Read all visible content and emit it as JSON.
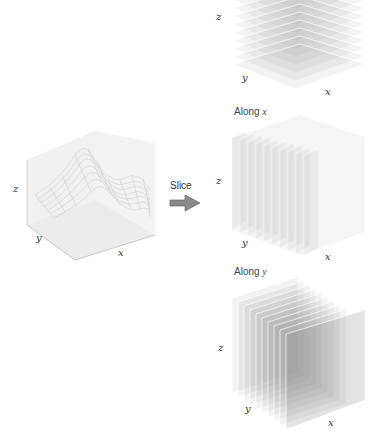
{
  "source_panel": {
    "title": "3D surface",
    "axes": {
      "x": "x",
      "y": "y",
      "z": "z"
    }
  },
  "arrow": {
    "label": "Slice",
    "color": "#808080"
  },
  "slice_panels": [
    {
      "id": "along-z",
      "caption_prefix": "",
      "caption_var": "",
      "axes": {
        "x": "x",
        "y": "y",
        "z": "z"
      },
      "num_slices": 10
    },
    {
      "id": "along-x",
      "caption_prefix": "Along ",
      "caption_var": "x",
      "axes": {
        "x": "x",
        "y": "y",
        "z": "z"
      },
      "num_slices": 10
    },
    {
      "id": "along-y",
      "caption_prefix": "Along ",
      "caption_var": "y",
      "axes": {
        "x": "x",
        "y": "y",
        "z": "z"
      },
      "num_slices": 10
    }
  ]
}
